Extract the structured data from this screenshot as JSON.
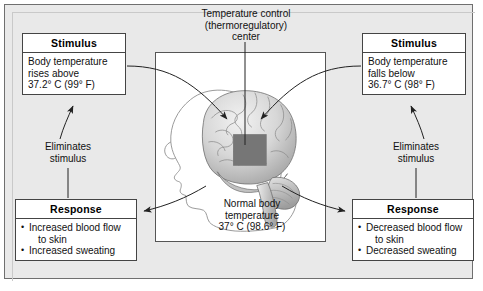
{
  "diagram": {
    "center_label": {
      "line1": "Temperature control",
      "line2": "(thermoregulatory)",
      "line3": "center"
    },
    "normal_temp_label": {
      "line1": "Normal body",
      "line2": "temperature",
      "line3": "37° C (98.6° F)"
    },
    "eliminates_left": {
      "line1": "Eliminates",
      "line2": "stimulus"
    },
    "eliminates_right": {
      "line1": "Eliminates",
      "line2": "stimulus"
    },
    "stimulus_left": {
      "title": "Stimulus",
      "line1": "Body temperature",
      "line2": "rises above",
      "line3": "37.2° C (99° F)"
    },
    "stimulus_right": {
      "title": "Stimulus",
      "line1": "Body temperature",
      "line2": "falls below",
      "line3": "36.7° C (98° F)"
    },
    "response_left": {
      "title": "Response",
      "item1": "Increased blood flow",
      "item1_cont": "to skin",
      "item2": "Increased sweating"
    },
    "response_right": {
      "title": "Response",
      "item1": "Decreased blood flow",
      "item1_cont": "to skin",
      "item2": "Decreased sweating"
    },
    "illustration": {
      "name": "human-head-profile-with-brain",
      "hypothalamus_region": "thermoregulatory-center-square"
    },
    "colors": {
      "background": "#e9e9e9",
      "box_fill": "#ffffff",
      "line": "#444444",
      "frame_fill": "#ffffff",
      "hypothalamus": "#767676"
    }
  }
}
